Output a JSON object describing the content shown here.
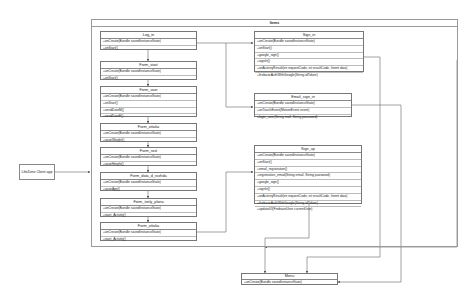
{
  "diagram": {
    "package": {
      "name": "Items"
    },
    "external": {
      "name": "LifeZone Client app"
    },
    "classes": [
      {
        "id": "log_in",
        "name": "Log_in",
        "ops": [
          "+onCreate(Bundle savedInstanceState)",
          "+onStart()"
        ]
      },
      {
        "id": "form_start",
        "name": "Form_start",
        "ops": [
          "+onCreate(Bundle savedInstanceState)",
          "+onStart()"
        ]
      },
      {
        "id": "form_vozrast",
        "name": "Form_vozr",
        "ops": [
          "+onCreate(Bundle savedInstanceState)",
          "+onStart()",
          "+sendDateM()",
          "+sendDateF()"
        ]
      },
      {
        "id": "form_ves",
        "name": "Form_ottaka",
        "ops": [
          "+onCreate(Bundle savedInstanceState)",
          "+saveWeight()"
        ]
      },
      {
        "id": "form_rost",
        "name": "Form_rost",
        "ops": [
          "+onCreate(Bundle savedInstanceState)",
          "+saveHeight()"
        ]
      },
      {
        "id": "form_data_pasp",
        "name": "Form_data_d_rozhda",
        "ops": [
          "+onCreate(Bundle savedInstanceState)",
          "+saveAge()"
        ]
      },
      {
        "id": "form_tsely",
        "name": "Form_tsely_plana",
        "ops": [
          "+onCreate(Bundle savedInstanceState)",
          "+start_Activity()"
        ]
      },
      {
        "id": "form_ottaka",
        "name": "Form_ottaka",
        "ops": [
          "+onCreate(Bundle savedInstanceState)",
          "+start_Activity()"
        ]
      },
      {
        "id": "sign_in",
        "name": "Sign_in",
        "ops": [
          "+onCreate(Bundle savedInstanceState)",
          "+onStart()",
          "+google_sign()",
          "+signIn()",
          "+onActivityResult(int requestCode, int resultCode, Intent data)",
          "+firebaseAuthWithGoogle(String idToken)"
        ]
      },
      {
        "id": "email_sign_in",
        "name": "Email_sign_in",
        "ops": [
          "+onCreate(Bundle savedInstanceState)",
          "+onTouchEvent(MotionEvent event)",
          "+login_user(String mail, String password)"
        ]
      },
      {
        "id": "sign_up",
        "name": "Sign_up",
        "ops": [
          "+onCreate(Bundle savedInstanceState)",
          "+onStart()",
          "+email_registration()",
          "+registration_email(String email, String password)",
          "+google_sign()",
          "+signIn()",
          "+onActivityResult(int requestCode, int resultCode, Intent data)",
          "+firebaseAuthWithGoogle(String idToken)",
          "+updateUI(FirebaseUser currentUser)"
        ]
      },
      {
        "id": "menu",
        "name": "Menu",
        "ops": [
          "+onCreate(Bundle savedInstanceState)"
        ]
      }
    ],
    "connections": [
      {
        "from": "LifeZone Client app",
        "to": "Items"
      },
      {
        "from": "Log_in",
        "to": "Form_start"
      },
      {
        "from": "Form_start",
        "to": "Form_vozr"
      },
      {
        "from": "Form_vozr",
        "to": "Form_ottaka"
      },
      {
        "from": "Form_ottaka",
        "to": "Form_rost"
      },
      {
        "from": "Form_rost",
        "to": "Form_data_d_rozhda"
      },
      {
        "from": "Form_data_d_rozhda",
        "to": "Form_tsely_plana"
      },
      {
        "from": "Form_tsely_plana",
        "to": "Form_ottaka"
      },
      {
        "from": "Log_in",
        "to": "Sign_in"
      },
      {
        "from": "Log_in",
        "to": "Email_sign_in"
      },
      {
        "from": "Form_ottaka",
        "to": "Sign_up"
      },
      {
        "from": "Sign_in",
        "to": "Menu"
      },
      {
        "from": "Email_sign_in",
        "to": "Menu"
      },
      {
        "from": "Sign_up",
        "to": "Menu"
      },
      {
        "from": "Items",
        "to": "Menu"
      }
    ]
  }
}
